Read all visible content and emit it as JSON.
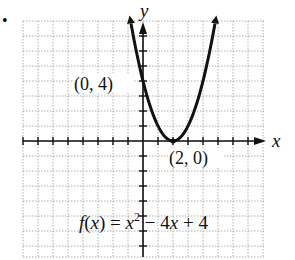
{
  "bullet": "•",
  "chart_data": {
    "type": "line",
    "title": "",
    "function": "f(x) = x^2 - 4x + 4",
    "xlabel": "x",
    "ylabel": "y",
    "xlim": [
      -8,
      8
    ],
    "ylim": [
      -8,
      8
    ],
    "grid": true,
    "grid_step": 1,
    "series": [
      {
        "name": "f(x) = x^2 - 4x + 4",
        "x": [
          -0.8,
          -0.5,
          0,
          0.5,
          1,
          1.5,
          2,
          2.5,
          3,
          3.5,
          4,
          4.5,
          4.8
        ],
        "y": [
          7.84,
          6.25,
          4,
          2.25,
          1,
          0.25,
          0,
          0.25,
          1,
          2.25,
          4,
          6.25,
          7.84
        ]
      }
    ],
    "annotations": [
      {
        "text": "(0, 4)",
        "x": 0,
        "y": 4
      },
      {
        "text": "(2, 0)",
        "x": 2,
        "y": 0
      }
    ]
  },
  "labels": {
    "x_axis": "x",
    "y_axis": "y",
    "point_a": "(0, 4)",
    "point_b": "(2, 0)",
    "eq_f": "f(x) = ",
    "eq_x": "x",
    "eq_sup": "2",
    "eq_rest": " − 4x + 4"
  }
}
